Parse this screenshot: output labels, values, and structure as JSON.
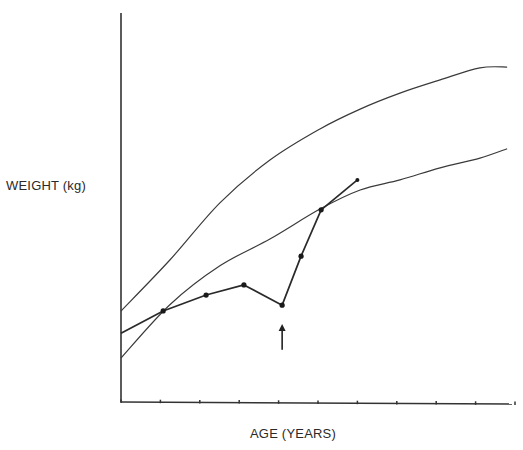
{
  "chart_data": {
    "type": "line",
    "title": "",
    "xlabel": "AGE (YEARS)",
    "ylabel": "WEIGHT (kg)",
    "x_ticks_count": 10,
    "x_tick_labels": [],
    "y_tick_labels": [],
    "grid": false,
    "legend": null,
    "units_note": "Axes unlabeled; x in tick units (0-10), y in relative units (0-100)",
    "xlim": [
      0,
      10
    ],
    "ylim": [
      0,
      100
    ],
    "series": [
      {
        "name": "upper-reference-curve",
        "style": "thin-line",
        "x": [
          0,
          1.24,
          2.51,
          3.78,
          5.05,
          6.07,
          7.08,
          8.1,
          9.11,
          9.8
        ],
        "y": [
          23.4,
          36.5,
          51.2,
          62.2,
          70.2,
          75.3,
          79.4,
          82.8,
          85.9,
          86.1
        ]
      },
      {
        "name": "lower-reference-curve",
        "style": "thin-line",
        "x": [
          0,
          1.24,
          2.51,
          3.78,
          5.05,
          6.07,
          7.08,
          8.1,
          9.11,
          9.8
        ],
        "y": [
          11.3,
          25.0,
          35.0,
          41.9,
          49.6,
          54.5,
          57.1,
          60.2,
          62.7,
          65.1
        ]
      },
      {
        "name": "patient-weight",
        "style": "line-with-markers",
        "x": [
          0,
          1.07,
          2.16,
          3.12,
          4.09,
          4.57,
          5.08,
          6.0
        ],
        "y": [
          17.7,
          23.4,
          27.5,
          30.1,
          24.9,
          37.5,
          49.4,
          57.1
        ]
      }
    ],
    "annotations": [
      {
        "type": "arrow",
        "direction": "up",
        "x": 4.09,
        "y_from": 13.4,
        "y_to": 19.8,
        "label": ""
      }
    ]
  },
  "labels": {
    "y_axis": "WEIGHT (kg)",
    "x_axis": "AGE (YEARS)"
  }
}
